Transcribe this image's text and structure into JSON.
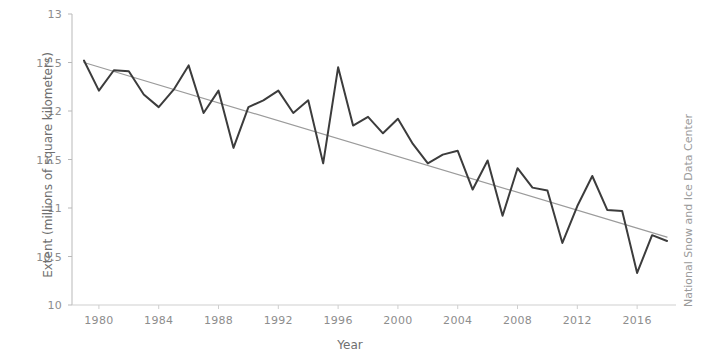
{
  "chart_data": {
    "type": "line",
    "title": "",
    "subtitle": "",
    "xlabel": "Year",
    "ylabel": "Extent (millions of square kilometers)",
    "credit": "National Snow and Ice Data Center",
    "grid": false,
    "legend_position": "none",
    "xlim": [
      1978.2,
      2018.6
    ],
    "ylim": [
      10,
      13
    ],
    "xticks": [
      1980,
      1984,
      1988,
      1992,
      1996,
      2000,
      2004,
      2008,
      2012,
      2016
    ],
    "xtick_labels": [
      "1980",
      "1984",
      "1988",
      "1992",
      "1996",
      "2000",
      "2004",
      "2008",
      "2012",
      "2016"
    ],
    "yticks": [
      10,
      10.5,
      11,
      11.5,
      12,
      12.5,
      13
    ],
    "ytick_labels": [
      "10",
      "10.5",
      "11",
      "11.5",
      "12",
      "12.5",
      "13"
    ],
    "x": [
      1979,
      1980,
      1981,
      1982,
      1983,
      1984,
      1985,
      1986,
      1987,
      1988,
      1989,
      1990,
      1991,
      1992,
      1993,
      1994,
      1995,
      1996,
      1997,
      1998,
      1999,
      2000,
      2001,
      2002,
      2003,
      2004,
      2005,
      2006,
      2007,
      2008,
      2009,
      2010,
      2011,
      2012,
      2013,
      2014,
      2015,
      2016,
      2017,
      2018
    ],
    "series": [
      {
        "name": "Arctic sea ice extent",
        "color": "#3c3c3c",
        "width": 2.0,
        "values": [
          12.52,
          12.21,
          12.42,
          12.41,
          12.17,
          12.04,
          12.22,
          12.47,
          11.98,
          12.21,
          11.62,
          12.04,
          12.11,
          12.21,
          11.98,
          12.11,
          11.46,
          12.45,
          11.85,
          11.94,
          11.77,
          11.92,
          11.66,
          11.46,
          11.55,
          11.59,
          11.19,
          11.49,
          10.92,
          11.41,
          11.21,
          11.18,
          10.64,
          11.02,
          11.33,
          10.98,
          10.97,
          10.33,
          10.72,
          10.66
        ]
      },
      {
        "name": "Linear trend",
        "color": "#9b9b9b",
        "width": 1.2,
        "x": [
          1979,
          2018
        ],
        "values": [
          12.5,
          10.7
        ]
      }
    ]
  },
  "axes": {
    "y_axis_name": "y-axis",
    "x_axis_name": "x-axis"
  }
}
